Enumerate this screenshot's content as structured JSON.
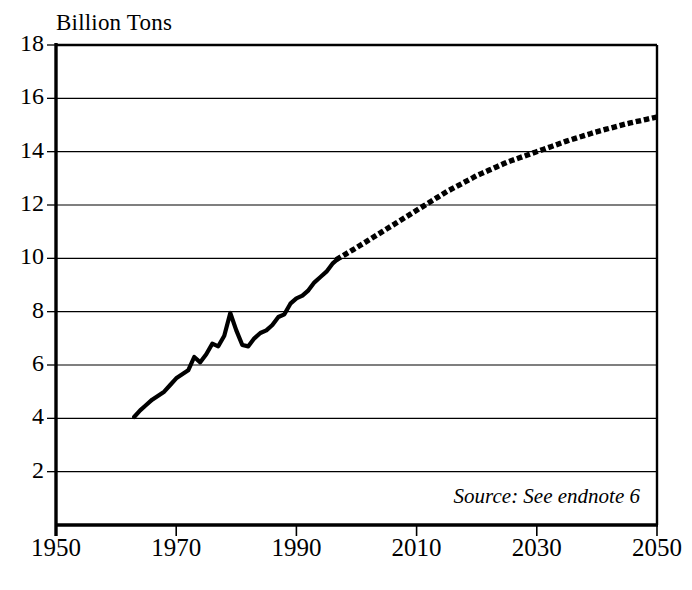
{
  "chart_data": {
    "type": "line",
    "title": "Billion Tons",
    "xlabel": "",
    "ylabel": "Billion Tons",
    "xlim": [
      1950,
      2050
    ],
    "ylim": [
      0,
      18
    ],
    "xticks": [
      1950,
      1970,
      1990,
      2010,
      2030,
      2050
    ],
    "yticks": [
      2,
      4,
      6,
      8,
      10,
      12,
      14,
      16,
      18
    ],
    "grid": "horizontal",
    "legend": "none",
    "annotations": [
      "Source: See endnote 6"
    ],
    "series": [
      {
        "name": "Historical",
        "style": "solid",
        "x": [
          1963,
          1964,
          1965,
          1966,
          1967,
          1968,
          1969,
          1970,
          1971,
          1972,
          1973,
          1974,
          1975,
          1976,
          1977,
          1978,
          1979,
          1980,
          1981,
          1982,
          1983,
          1984,
          1985,
          1986,
          1987,
          1988,
          1989,
          1990,
          1991,
          1992,
          1993,
          1994,
          1995,
          1996,
          1997
        ],
        "y": [
          4.05,
          4.3,
          4.5,
          4.7,
          4.85,
          5.0,
          5.25,
          5.5,
          5.65,
          5.8,
          6.3,
          6.1,
          6.4,
          6.8,
          6.7,
          7.1,
          7.95,
          7.3,
          6.75,
          6.7,
          7.0,
          7.2,
          7.3,
          7.5,
          7.8,
          7.9,
          8.3,
          8.5,
          8.6,
          8.8,
          9.1,
          9.3,
          9.5,
          9.8,
          10.0
        ]
      },
      {
        "name": "Projection",
        "style": "dotted",
        "x": [
          1997,
          2000,
          2005,
          2010,
          2015,
          2020,
          2025,
          2030,
          2035,
          2040,
          2045,
          2050
        ],
        "y": [
          10.0,
          10.4,
          11.1,
          11.8,
          12.5,
          13.1,
          13.6,
          14.0,
          14.4,
          14.75,
          15.05,
          15.3
        ]
      }
    ]
  },
  "axes": {
    "y_tick_labels": [
      "18",
      "16",
      "14",
      "12",
      "10",
      "8",
      "6",
      "4",
      "2"
    ],
    "x_tick_labels": [
      "1950",
      "1970",
      "1990",
      "2010",
      "2030",
      "2050"
    ]
  },
  "footer": {
    "source_text": "Source: See endnote 6"
  }
}
